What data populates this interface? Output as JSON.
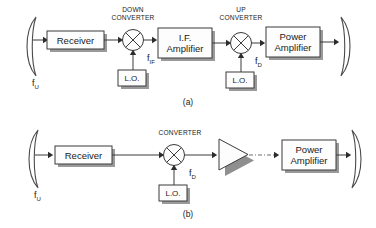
{
  "figure": {
    "background_color": "#ffffff",
    "line_color": "#3b3b3b",
    "shadow_color": "#8f8f8f"
  },
  "panel_a": {
    "caption": "(a)",
    "antenna_in_name": "receive-antenna",
    "antenna_out_name": "transmit-antenna",
    "input_freq": "f",
    "input_freq_sub": "U",
    "receiver_label": "Receiver",
    "down_converter_caption_line1": "DOWN",
    "down_converter_caption_line2": "CONVERTER",
    "lo1_label": "L.O.",
    "if_freq": "f",
    "if_freq_sub": "IF",
    "if_amp_line1": "I.F.",
    "if_amp_line2": "Amplifier",
    "up_converter_caption_line1": "UP",
    "up_converter_caption_line2": "CONVERTER",
    "lo2_label": "L.O.",
    "down_freq": "f",
    "down_freq_sub": "D",
    "power_amp_line1": "Power",
    "power_amp_line2": "Amplifier"
  },
  "panel_b": {
    "caption": "(b)",
    "antenna_in_name": "receive-antenna",
    "antenna_out_name": "transmit-antenna",
    "input_freq": "f",
    "input_freq_sub": "U",
    "receiver_label": "Receiver",
    "converter_caption": "CONVERTER",
    "lo_label": "L.O.",
    "down_freq": "f",
    "down_freq_sub": "D",
    "amplifier_name": "triangle-amplifier",
    "power_amp_line1": "Power",
    "power_amp_line2": "Amplifier"
  }
}
